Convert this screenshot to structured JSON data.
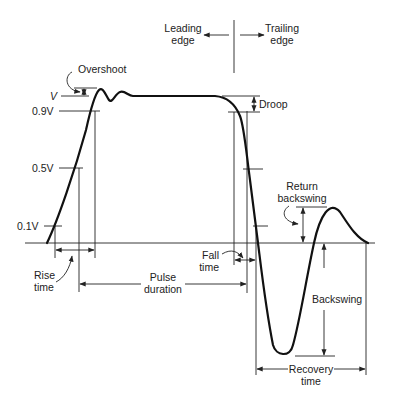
{
  "diagram": {
    "regions": {
      "leading_edge": [
        "Leading",
        "edge"
      ],
      "trailing_edge": [
        "Trailing",
        "edge"
      ]
    },
    "levels": {
      "v": "V",
      "v90": "0.9V",
      "v50": "0.5V",
      "v10": "0.1V"
    },
    "annotations": {
      "overshoot": "Overshoot",
      "droop": "Droop",
      "rise_time": [
        "Rise",
        "time"
      ],
      "fall_time": [
        "Fall",
        "time"
      ],
      "pulse_duration": [
        "Pulse",
        "duration"
      ],
      "return_backswing": [
        "Return",
        "backswing"
      ],
      "backswing": "Backswing",
      "recovery_time": [
        "Recovery",
        "time"
      ]
    },
    "colors": {
      "stroke": "#111111",
      "background": "#ffffff"
    }
  }
}
